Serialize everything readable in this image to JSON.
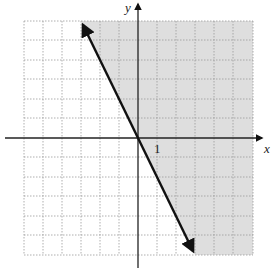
{
  "diagram": {
    "type": "linear-inequality-graph",
    "axes": {
      "x_label": "x",
      "y_label": "y",
      "tick_label": "1"
    },
    "grid": {
      "x_min": -6,
      "x_max": 6,
      "y_min": -6,
      "y_max": 6,
      "style": "dotted"
    },
    "boundary_line": {
      "style": "solid",
      "passes_through": [
        [
          -3,
          6
        ],
        [
          0,
          0
        ],
        [
          3,
          -6
        ]
      ],
      "slope": -2,
      "arrows": "both"
    },
    "shaded_region": "right of line",
    "colors": {
      "shade": "#dedede",
      "grid": "#9a9a9a",
      "axis": "#222222",
      "line": "#111111"
    }
  }
}
